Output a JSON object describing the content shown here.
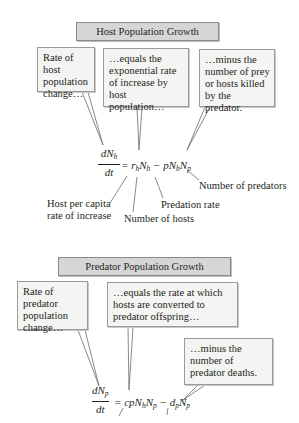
{
  "host": {
    "title": "Host Population Growth",
    "callouts": [
      "Rate of host population change…",
      "…equals the exponential rate of increase by host population…",
      "…minus the number of prey or hosts killed by the predator."
    ],
    "equation": {
      "numerator": "dN",
      "numerator_sub": "h",
      "denominator": "dt",
      "rhs_parts": [
        "= r",
        "h",
        "N",
        "h",
        " − pN",
        "h",
        "N",
        "p"
      ]
    },
    "labels": {
      "per_capita_line1": "Host per capita",
      "per_capita_line2": "rate of increase",
      "number_of_hosts": "Number of hosts",
      "predation_rate": "Predation rate",
      "number_of_predators": "Number of predators"
    }
  },
  "predator": {
    "title": "Predator Population Growth",
    "callouts": [
      "Rate of predator population change…",
      "…equals the rate at which hosts are converted to predator offspring…",
      "…minus the number of predator deaths."
    ],
    "equation": {
      "numerator": "dN",
      "numerator_sub": "p",
      "denominator": "dt",
      "rhs_parts": [
        "= cpN",
        "h",
        "N",
        "p",
        " − d",
        "p",
        "N",
        "p"
      ]
    }
  }
}
